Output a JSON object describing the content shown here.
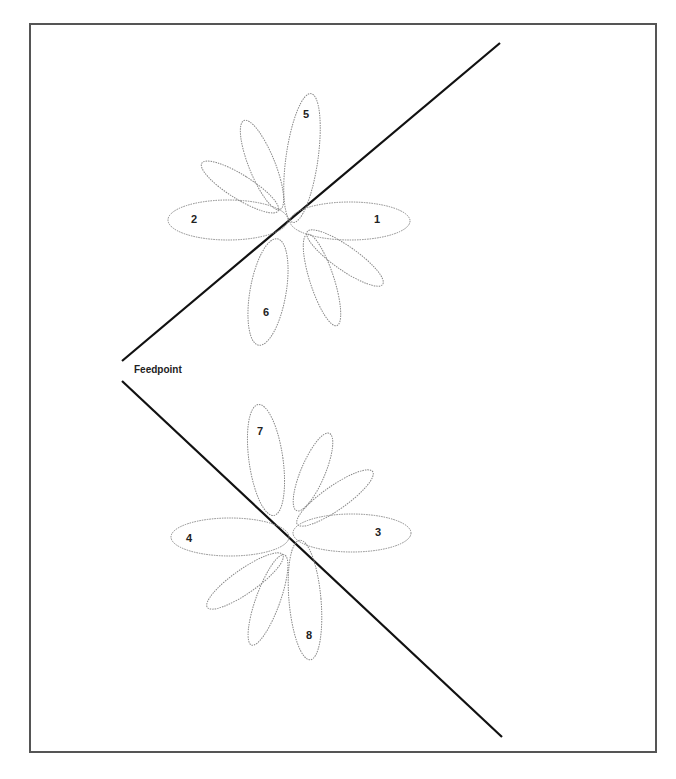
{
  "diagram": {
    "feedpoint_label": "Feedpoint",
    "lobe_labels": [
      "1",
      "2",
      "3",
      "4",
      "5",
      "6",
      "7",
      "8"
    ],
    "colors": {
      "wire": "#111111",
      "lobe": "#888888",
      "frame": "#555555"
    }
  }
}
